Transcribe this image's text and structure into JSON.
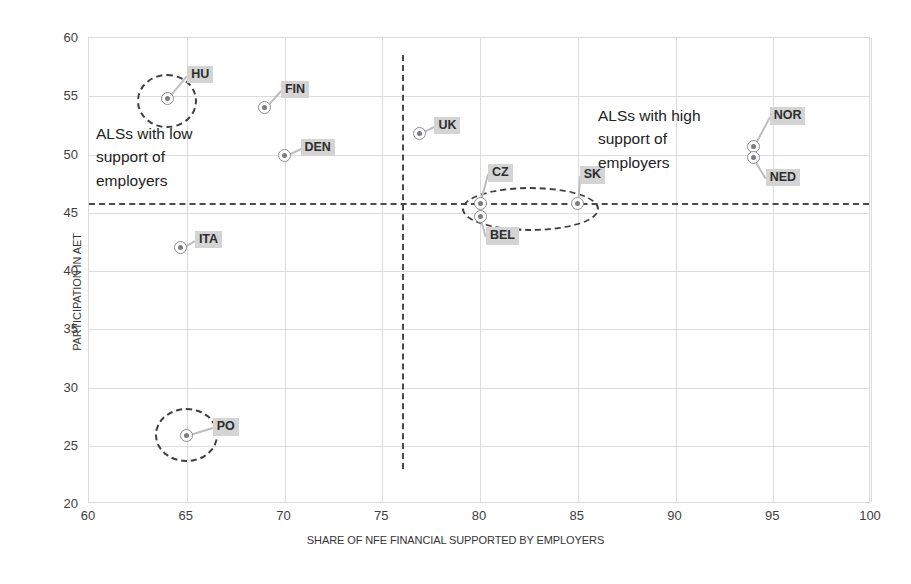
{
  "chart_data": {
    "type": "scatter",
    "title": "",
    "xlabel": "SHARE OF NFE FINANCIAL SUPPORTED BY EMPLOYERS",
    "ylabel": "PARTICIPATION IN AET",
    "xlim": [
      60,
      100
    ],
    "ylim": [
      20,
      60
    ],
    "xticks": [
      60,
      65,
      70,
      75,
      80,
      85,
      90,
      95,
      100
    ],
    "yticks": [
      20,
      25,
      30,
      35,
      40,
      45,
      50,
      55,
      60
    ],
    "grid": true,
    "legend": "none",
    "points": [
      {
        "label": "HU",
        "x": 64.0,
        "y": 54.8,
        "label_dx": 20,
        "label_dy": -24
      },
      {
        "label": "FIN",
        "x": 69.0,
        "y": 54.0,
        "label_dx": 16,
        "label_dy": -18
      },
      {
        "label": "DEN",
        "x": 70.0,
        "y": 49.9,
        "label_dx": 16,
        "label_dy": -8
      },
      {
        "label": "ITA",
        "x": 64.7,
        "y": 42.0,
        "label_dx": 14,
        "label_dy": -8
      },
      {
        "label": "PO",
        "x": 65.0,
        "y": 25.9,
        "label_dx": 26,
        "label_dy": -8
      },
      {
        "label": "UK",
        "x": 76.9,
        "y": 51.8,
        "label_dx": 15,
        "label_dy": -8
      },
      {
        "label": "CZ",
        "x": 80.0,
        "y": 45.8,
        "label_dx": 8,
        "label_dy": -30
      },
      {
        "label": "BEL",
        "x": 80.0,
        "y": 44.7,
        "label_dx": 6,
        "label_dy": 20
      },
      {
        "label": "SK",
        "x": 85.0,
        "y": 45.8,
        "label_dx": 2,
        "label_dy": -28
      },
      {
        "label": "NOR",
        "x": 94.0,
        "y": 50.7,
        "label_dx": 16,
        "label_dy": -30
      },
      {
        "label": "NED",
        "x": 94.0,
        "y": 49.7,
        "label_dx": 12,
        "label_dy": 20
      }
    ],
    "reference_lines": [
      {
        "orientation": "horizontal",
        "value": 45.8,
        "style": "dashed"
      },
      {
        "orientation": "vertical",
        "value": 76.0,
        "style": "dashed",
        "y_from": 23.0,
        "y_to": 58.5
      }
    ],
    "highlight_ellipses": [
      {
        "cx": 64.0,
        "cy": 54.6,
        "rx": 1.55,
        "ry": 2.3
      },
      {
        "cx": 65.0,
        "cy": 25.9,
        "rx": 1.6,
        "ry": 2.3
      },
      {
        "cx": 82.6,
        "cy": 45.3,
        "rx": 3.5,
        "ry": 1.9
      }
    ],
    "annotations": [
      {
        "name": "low-support",
        "text": "ALSs with low\nsupport of\nemployers"
      },
      {
        "name": "high-support",
        "text": "ALSs with high\nsupport of\nemployers"
      }
    ]
  },
  "colors": {
    "background": "#ffffff",
    "grid": "#dcdce1",
    "plot_border": "#d9d9de",
    "marker_stroke": "#8d8d93",
    "marker_core": "#7c7c82",
    "label_background": "#d4d4d4",
    "label_text": "#2e2e2e",
    "reference_line": "#4b4b4f",
    "axis_text": "#404040"
  }
}
